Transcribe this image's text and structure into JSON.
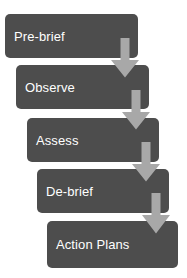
{
  "diagram": {
    "type": "cascading-process-flow",
    "title": "",
    "orientation": "vertical-staircase",
    "colors": {
      "stage_fill": "#4d4d4d",
      "stage_text": "#ffffff",
      "arrow_fill": "#a8a8a8",
      "background": "#ffffff"
    },
    "stages": [
      {
        "label": "Pre-brief",
        "order": 1,
        "x": 5,
        "y": 14,
        "width": 133,
        "height": 44
      },
      {
        "label": "Observe",
        "order": 2,
        "x": 16,
        "y": 65,
        "width": 133,
        "height": 44
      },
      {
        "label": "Assess",
        "order": 3,
        "x": 27,
        "y": 118,
        "width": 132,
        "height": 44
      },
      {
        "label": "De-brief",
        "order": 4,
        "x": 37,
        "y": 169,
        "width": 132,
        "height": 44
      },
      {
        "label": "Action Plans",
        "order": 5,
        "x": 47,
        "y": 221,
        "width": 131,
        "height": 47
      }
    ],
    "connectors": [
      {
        "name": "arrow-pre-brief-to-observe",
        "from": "Pre-brief",
        "to": "Observe",
        "x": 110,
        "y": 38,
        "width": 30,
        "height": 40
      },
      {
        "name": "arrow-observe-to-assess",
        "from": "Observe",
        "to": "Assess",
        "x": 121,
        "y": 90,
        "width": 30,
        "height": 40
      },
      {
        "name": "arrow-assess-to-de-brief",
        "from": "Assess",
        "to": "De-brief",
        "x": 131,
        "y": 142,
        "width": 30,
        "height": 40
      },
      {
        "name": "arrow-de-brief-to-action-plans",
        "from": "De-brief",
        "to": "Action Plans",
        "x": 141,
        "y": 193,
        "width": 30,
        "height": 41
      }
    ]
  }
}
